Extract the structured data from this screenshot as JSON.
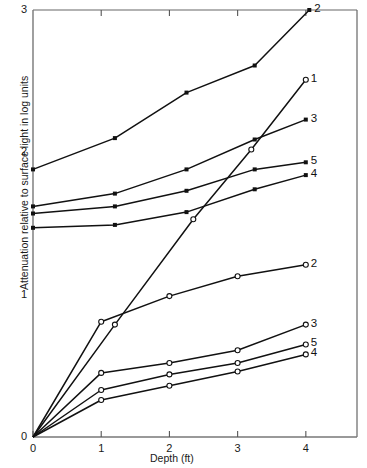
{
  "chart_data": {
    "type": "line",
    "title": "",
    "xlabel": "Depth (ft)",
    "ylabel": "Attenuation relative to surface light in log units",
    "xlim": [
      0,
      4.75
    ],
    "ylim": [
      3,
      0
    ],
    "y_inverted": true,
    "xticks": [
      0,
      1,
      2,
      3,
      4
    ],
    "xticklabels": [
      "0",
      "1",
      "2",
      "3",
      "4"
    ],
    "yticks": [
      0,
      1,
      2,
      3
    ],
    "yticklabels": [
      "0",
      "1",
      "2",
      "3"
    ],
    "grid": false,
    "legend_position": "inline-right-of-line-end",
    "marker_styles": {
      "open_group": "open-circle",
      "filled_group": "filled-square"
    },
    "series": [
      {
        "name": "4",
        "group": "upper",
        "marker": "open-circle",
        "end_label": "4",
        "x": [
          0,
          1,
          2,
          3,
          4
        ],
        "y": [
          0.0,
          0.26,
          0.36,
          0.46,
          0.58
        ]
      },
      {
        "name": "5",
        "group": "upper",
        "marker": "open-circle",
        "end_label": "5",
        "x": [
          0,
          1,
          2,
          3,
          4
        ],
        "y": [
          0.0,
          0.33,
          0.44,
          0.52,
          0.65
        ]
      },
      {
        "name": "3",
        "group": "upper",
        "marker": "open-circle",
        "end_label": "3",
        "x": [
          0,
          1,
          2,
          3,
          4
        ],
        "y": [
          0.0,
          0.45,
          0.52,
          0.61,
          0.79
        ]
      },
      {
        "name": "2",
        "group": "upper",
        "marker": "open-circle",
        "end_label": "2",
        "x": [
          0,
          1,
          2,
          3,
          4
        ],
        "y": [
          0.0,
          0.81,
          0.99,
          1.13,
          1.21
        ]
      },
      {
        "name": "1",
        "group": "upper",
        "marker": "open-circle",
        "end_label": "1",
        "x": [
          0,
          1.2,
          2.35,
          3.2,
          4.0
        ],
        "y": [
          0.0,
          0.79,
          1.53,
          2.02,
          2.51
        ]
      },
      {
        "name": "4",
        "group": "lower",
        "marker": "filled-square",
        "end_label": "4",
        "x": [
          0,
          1.2,
          2.25,
          3.25,
          4.0
        ],
        "y": [
          1.47,
          1.49,
          1.58,
          1.74,
          1.84
        ]
      },
      {
        "name": "5",
        "group": "lower",
        "marker": "filled-square",
        "end_label": "5",
        "x": [
          0,
          1.2,
          2.25,
          3.25,
          4.0
        ],
        "y": [
          1.57,
          1.62,
          1.73,
          1.88,
          1.93
        ]
      },
      {
        "name": "3",
        "group": "lower",
        "marker": "filled-square",
        "end_label": "3",
        "x": [
          0,
          1.2,
          2.25,
          3.25,
          4.0
        ],
        "y": [
          1.62,
          1.71,
          1.88,
          2.09,
          2.23
        ]
      },
      {
        "name": "2",
        "group": "lower",
        "marker": "filled-square",
        "end_label": "2",
        "x": [
          0,
          1.2,
          2.25,
          3.25,
          4.05
        ],
        "y": [
          1.88,
          2.1,
          2.42,
          2.61,
          3.0
        ]
      }
    ],
    "colors": {
      "line": "#111111",
      "axis": "#555555",
      "text": "#1a1a1a",
      "background": "#ffffff"
    }
  }
}
